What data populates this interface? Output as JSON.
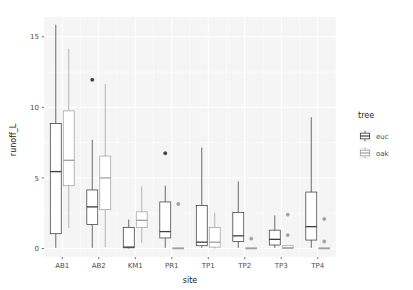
{
  "chart_data": {
    "type": "box",
    "title": "",
    "subtitle": "",
    "xlabel": "site",
    "ylabel": "runoff_L",
    "categories": [
      "AB1",
      "AB2",
      "KM1",
      "PR1",
      "TP1",
      "TP2",
      "TP3",
      "TP4"
    ],
    "yticks": [
      0,
      5,
      10,
      15
    ],
    "ylim": [
      -0.6,
      16.4
    ],
    "grid": true,
    "legend": {
      "title": "tree",
      "position": "right",
      "entries": [
        {
          "label": "euc",
          "color": "#3d3d3d"
        },
        {
          "label": "oak",
          "color": "#a0a0a0"
        }
      ]
    },
    "series": [
      {
        "name": "euc",
        "color": "#3d3d3d",
        "boxes": [
          {
            "category": "AB1",
            "min": 0.05,
            "q1": 1.05,
            "median": 5.45,
            "q3": 8.85,
            "max": 15.85,
            "outliers": []
          },
          {
            "category": "AB2",
            "min": 0.05,
            "q1": 1.7,
            "median": 2.95,
            "q3": 4.15,
            "max": 7.7,
            "outliers": [
              11.95
            ]
          },
          {
            "category": "KM1",
            "min": 0.0,
            "q1": 0.05,
            "median": 0.1,
            "q3": 1.5,
            "max": 2.05,
            "outliers": []
          },
          {
            "category": "PR1",
            "min": 0.05,
            "q1": 0.75,
            "median": 1.2,
            "q3": 3.3,
            "max": 4.45,
            "outliers": [
              6.75
            ]
          },
          {
            "category": "TP1",
            "min": 0.05,
            "q1": 0.2,
            "median": 0.45,
            "q3": 3.05,
            "max": 7.15,
            "outliers": []
          },
          {
            "category": "TP2",
            "min": 0.05,
            "q1": 0.5,
            "median": 0.9,
            "q3": 2.55,
            "max": 4.75,
            "outliers": []
          },
          {
            "category": "TP3",
            "min": 0.05,
            "q1": 0.25,
            "median": 0.65,
            "q3": 1.3,
            "max": 2.35,
            "outliers": []
          },
          {
            "category": "TP4",
            "min": 0.05,
            "q1": 0.6,
            "median": 1.55,
            "q3": 4.0,
            "max": 9.3,
            "outliers": []
          }
        ]
      },
      {
        "name": "oak",
        "color": "#a0a0a0",
        "boxes": [
          {
            "category": "AB1",
            "min": 1.45,
            "q1": 4.45,
            "median": 6.25,
            "q3": 9.75,
            "max": 14.15,
            "outliers": []
          },
          {
            "category": "AB2",
            "min": 0.1,
            "q1": 2.75,
            "median": 5.0,
            "q3": 6.55,
            "max": 11.65,
            "outliers": []
          },
          {
            "category": "KM1",
            "min": 0.4,
            "q1": 1.5,
            "median": 2.0,
            "q3": 2.6,
            "max": 4.4,
            "outliers": []
          },
          {
            "category": "PR1",
            "min": 0.0,
            "q1": 0.0,
            "median": 0.0,
            "q3": 0.05,
            "max": 0.05,
            "outliers": [
              3.15
            ]
          },
          {
            "category": "TP1",
            "min": 0.0,
            "q1": 0.1,
            "median": 0.45,
            "q3": 1.5,
            "max": 2.55,
            "outliers": []
          },
          {
            "category": "TP2",
            "min": 0.0,
            "q1": 0.0,
            "median": 0.0,
            "q3": 0.05,
            "max": 0.05,
            "outliers": [
              0.7
            ]
          },
          {
            "category": "TP3",
            "min": 0.0,
            "q1": 0.0,
            "median": 0.05,
            "q3": 0.2,
            "max": 0.25,
            "outliers": [
              0.95,
              2.4
            ]
          },
          {
            "category": "TP4",
            "min": 0.0,
            "q1": 0.0,
            "median": 0.0,
            "q3": 0.05,
            "max": 0.05,
            "outliers": [
              0.5,
              2.1
            ]
          }
        ]
      }
    ]
  },
  "style": {
    "panel_background": "#f5f5f5",
    "grid_color": "#ffffff",
    "text_color": "#4d4d4d",
    "title_color": "#1a1a1a"
  }
}
